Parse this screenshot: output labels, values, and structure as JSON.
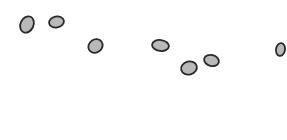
{
  "scene": {
    "background": "#ffffff",
    "stroke_color": "#2a2a2a",
    "fill_color": "#b9b9b9",
    "stroke_width": 1.8,
    "pebbles": [
      {
        "id": "pebble-1",
        "cx": 27,
        "cy": 24.5,
        "rx": 6.5,
        "ry": 8.5,
        "rotate": 25
      },
      {
        "id": "pebble-2",
        "cx": 56.5,
        "cy": 22,
        "rx": 7.5,
        "ry": 5.5,
        "rotate": -10
      },
      {
        "id": "pebble-3",
        "cx": 95.5,
        "cy": 46,
        "rx": 7.5,
        "ry": 6.5,
        "rotate": -35
      },
      {
        "id": "pebble-4",
        "cx": 160.5,
        "cy": 45.5,
        "rx": 8.5,
        "ry": 5.5,
        "rotate": 8
      },
      {
        "id": "pebble-5",
        "cx": 189,
        "cy": 68,
        "rx": 8,
        "ry": 6.5,
        "rotate": -15
      },
      {
        "id": "pebble-6",
        "cx": 211.5,
        "cy": 60.5,
        "rx": 7.5,
        "ry": 5.5,
        "rotate": 15
      },
      {
        "id": "pebble-7",
        "cx": 280.5,
        "cy": 49.5,
        "rx": 4.5,
        "ry": 6.5,
        "rotate": 10
      }
    ]
  }
}
